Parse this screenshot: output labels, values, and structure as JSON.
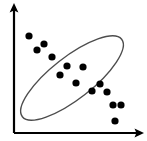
{
  "figure": {
    "title": "",
    "width": 147,
    "height": 141,
    "background_color": "#ffffff"
  },
  "chart_data": {
    "type": "scatter",
    "title": "",
    "xlabel": "",
    "ylabel": "",
    "xlim": [
      0,
      100
    ],
    "ylim": [
      0,
      100
    ],
    "grid": false,
    "legend": null,
    "series": [
      {
        "name": "points",
        "marker": "filled-circle",
        "color": "#000000",
        "marker_radius_px": 3.6,
        "points_px": [
          [
            29,
            36
          ],
          [
            44,
            44
          ],
          [
            37,
            50
          ],
          [
            52,
            57
          ],
          [
            60,
            75
          ],
          [
            67,
            66
          ],
          [
            83,
            67
          ],
          [
            76,
            83
          ],
          [
            92,
            91
          ],
          [
            100,
            84
          ],
          [
            107,
            92
          ],
          [
            113,
            105
          ],
          [
            121,
            105
          ],
          [
            115,
            121
          ]
        ],
        "x": [
          12,
          25,
          19,
          32,
          38,
          44,
          57,
          51,
          65,
          72,
          78,
          83,
          90,
          85
        ],
        "y": [
          75,
          69,
          64,
          59,
          45,
          52,
          51,
          38,
          32,
          38,
          31,
          21,
          21,
          9
        ]
      }
    ],
    "annotations": [
      {
        "name": "enclosing-ellipse",
        "type": "ellipse",
        "center_px": [
          72,
          78
        ],
        "rx_px": 63,
        "ry_px": 21,
        "rotation_deg": -38,
        "stroke": "#4d4d4d",
        "stroke_width": 1.4,
        "fill": "none"
      }
    ],
    "axes": {
      "x_axis": {
        "type": "arrow",
        "from_px": [
          14,
          133
        ],
        "to_px": [
          143,
          133
        ],
        "color": "#000000",
        "width_px": 2.2,
        "arrowhead": true,
        "ticks": [],
        "tick_labels": []
      },
      "y_axis": {
        "type": "arrow",
        "from_px": [
          14,
          133
        ],
        "to_px": [
          14,
          4
        ],
        "color": "#000000",
        "width_px": 2.2,
        "arrowhead": true,
        "ticks": [],
        "tick_labels": []
      }
    }
  }
}
